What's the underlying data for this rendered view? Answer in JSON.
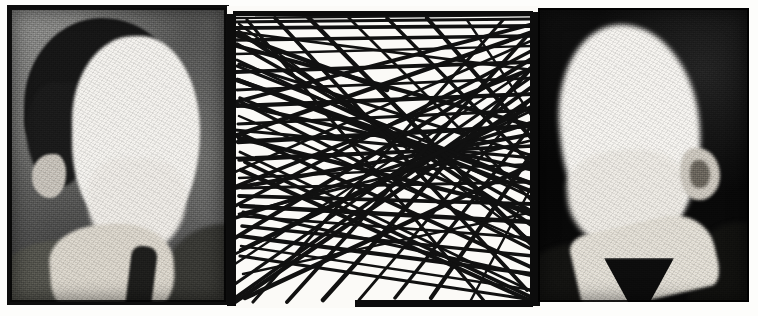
{
  "artwork": {
    "title": "Defaced double portrait with scribble field",
    "medium": "black-and-white halftone scan",
    "canvas": {
      "width": 758,
      "height": 316,
      "background": "#fdfdfb"
    },
    "panel_count": 3,
    "panels": [
      {
        "id": "left-photo",
        "kind": "photograph",
        "label": "Left portrait photograph",
        "description": "Grainy grey-toned studio portrait of a man in three-quarter view facing right; the face has been erased to a blank white shape. Dark hair, white shirt collar and dark tie visible.",
        "subject_facing": "right",
        "face_state": "blanked-white",
        "background_tone": "mid-grey",
        "rect": {
          "x": 10,
          "y": 8,
          "width": 216,
          "height": 294
        },
        "colors": {
          "background": "#6f6f6f",
          "hair": "#171717",
          "face": "#f4f2ee",
          "collar": "#dcd7cd",
          "tie": "#1f1f1d",
          "border": "#0d0d0d"
        }
      },
      {
        "id": "scribble-field",
        "kind": "line-drawing",
        "label": "Central scribble panel",
        "description": "Dense field of long straight black strokes criss-crossing a white ground, framed by heavy black vertical bars at left and right and long horizontal bars near the top and bottom.",
        "stroke_color": "#111111",
        "ground_color": "#fbfaf7",
        "stroke_count": 74,
        "rect": {
          "x": 227,
          "y": 6,
          "width": 313,
          "height": 302
        },
        "frame": {
          "left_bar": {
            "x": 0,
            "y": 8,
            "width": 9,
            "height": 292
          },
          "right_bar": {
            "x": 303,
            "y": 6,
            "width": 10,
            "height": 294
          },
          "top_bar": {
            "x": 6,
            "y": 5,
            "width": 300,
            "height": 5
          },
          "bottom_bar": {
            "x": 128,
            "y": 294,
            "width": 178,
            "height": 7
          }
        }
      },
      {
        "id": "right-photo",
        "kind": "photograph",
        "label": "Right portrait photograph",
        "description": "High-contrast portrait on a near-black ground of a man facing left; the face is burned out to a solid white silhouette with one ear visible at the right. A pale shirt collar forms a V below the chin over dark clothing.",
        "subject_facing": "left",
        "face_state": "blanked-white",
        "background_tone": "near-black",
        "rect": {
          "x": 538,
          "y": 8,
          "width": 211,
          "height": 294
        },
        "colors": {
          "background": "#0a0a0a",
          "face": "#f6f4f0",
          "ear": "#cfcac1",
          "collar": "#e4e0d7",
          "clothing": "#121210"
        }
      }
    ]
  },
  "chart_data": {
    "type": "scatter",
    "xlabel": "",
    "ylabel": "",
    "xlim": [
      0,
      313
    ],
    "ylim": [
      0,
      302
    ],
    "grid": false,
    "legend": "none",
    "stroke_width_px": 3.2,
    "strokes": [
      [
        6,
        12,
        306,
        9
      ],
      [
        6,
        16,
        306,
        13
      ],
      [
        8,
        22,
        306,
        20
      ],
      [
        7,
        28,
        160,
        84
      ],
      [
        9,
        26,
        306,
        64
      ],
      [
        8,
        34,
        306,
        30
      ],
      [
        10,
        40,
        306,
        120
      ],
      [
        9,
        48,
        306,
        40
      ],
      [
        12,
        58,
        306,
        150
      ],
      [
        9,
        66,
        306,
        56
      ],
      [
        11,
        74,
        306,
        186
      ],
      [
        10,
        84,
        306,
        72
      ],
      [
        13,
        92,
        306,
        210
      ],
      [
        10,
        100,
        306,
        88
      ],
      [
        12,
        110,
        306,
        238
      ],
      [
        11,
        118,
        306,
        104
      ],
      [
        14,
        128,
        306,
        262
      ],
      [
        11,
        136,
        306,
        120
      ],
      [
        13,
        146,
        306,
        286
      ],
      [
        12,
        154,
        306,
        140
      ],
      [
        14,
        164,
        306,
        296
      ],
      [
        12,
        172,
        306,
        158
      ],
      [
        15,
        182,
        306,
        176
      ],
      [
        12,
        190,
        306,
        198
      ],
      [
        14,
        200,
        306,
        216
      ],
      [
        13,
        210,
        306,
        232
      ],
      [
        15,
        220,
        306,
        250
      ],
      [
        13,
        230,
        306,
        268
      ],
      [
        14,
        240,
        306,
        284
      ],
      [
        13,
        250,
        306,
        294
      ],
      [
        306,
        18,
        8,
        96
      ],
      [
        306,
        26,
        8,
        130
      ],
      [
        306,
        34,
        8,
        166
      ],
      [
        306,
        44,
        8,
        200
      ],
      [
        306,
        52,
        8,
        232
      ],
      [
        306,
        60,
        8,
        258
      ],
      [
        306,
        70,
        8,
        278
      ],
      [
        306,
        80,
        8,
        292
      ],
      [
        306,
        92,
        8,
        296
      ],
      [
        306,
        104,
        8,
        248
      ],
      [
        306,
        116,
        8,
        212
      ],
      [
        306,
        128,
        8,
        182
      ],
      [
        306,
        140,
        8,
        152
      ],
      [
        306,
        152,
        8,
        124
      ],
      [
        306,
        164,
        8,
        98
      ],
      [
        306,
        178,
        10,
        74
      ],
      [
        306,
        192,
        10,
        54
      ],
      [
        306,
        206,
        10,
        38
      ],
      [
        306,
        220,
        12,
        26
      ],
      [
        306,
        236,
        12,
        18
      ],
      [
        20,
        14,
        258,
        296
      ],
      [
        48,
        12,
        300,
        284
      ],
      [
        80,
        10,
        306,
        240
      ],
      [
        120,
        10,
        306,
        196
      ],
      [
        160,
        12,
        306,
        160
      ],
      [
        200,
        12,
        306,
        134
      ],
      [
        240,
        14,
        306,
        112
      ],
      [
        26,
        296,
        276,
        14
      ],
      [
        60,
        296,
        300,
        30
      ],
      [
        96,
        294,
        306,
        60
      ],
      [
        132,
        294,
        306,
        90
      ],
      [
        168,
        292,
        306,
        118
      ],
      [
        204,
        292,
        306,
        146
      ],
      [
        244,
        294,
        306,
        178
      ],
      [
        10,
        60,
        306,
        178
      ],
      [
        10,
        180,
        306,
        62
      ],
      [
        12,
        132,
        306,
        206
      ],
      [
        12,
        208,
        306,
        134
      ],
      [
        14,
        96,
        306,
        244
      ],
      [
        14,
        244,
        306,
        100
      ],
      [
        16,
        268,
        306,
        206
      ],
      [
        16,
        206,
        306,
        270
      ],
      [
        18,
        156,
        306,
        292
      ],
      [
        18,
        292,
        306,
        158
      ]
    ]
  }
}
